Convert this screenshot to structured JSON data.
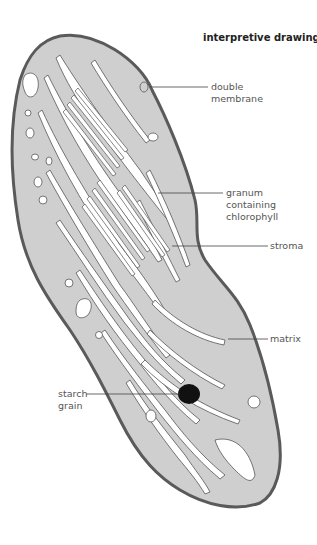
{
  "title": "interpretive drawing",
  "labels": {
    "double_membrane": "double\nmembrane",
    "granum": "granum\ncontaining\nchlorophyll",
    "stroma": "stroma",
    "matrix": "matrix",
    "starch_grain": "starch\ngrain"
  },
  "colors": {
    "matrix_fill": "#cfcfcf",
    "membrane": "#5a5a5a",
    "lamellae": "#ffffff",
    "starch": "#111111",
    "leader_line": "#444444",
    "label_text": "#555555"
  }
}
